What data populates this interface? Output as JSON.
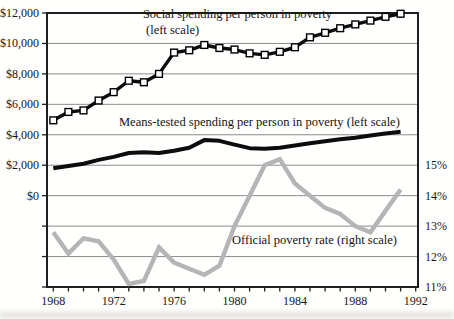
{
  "chart_data": {
    "type": "line",
    "x_years": [
      1968,
      1969,
      1970,
      1971,
      1972,
      1973,
      1974,
      1975,
      1976,
      1977,
      1978,
      1979,
      1980,
      1981,
      1982,
      1983,
      1984,
      1985,
      1986,
      1987,
      1988,
      1989,
      1990,
      1991
    ],
    "series": [
      {
        "name": "Social spending per person in poverty",
        "axis": "left",
        "marker": "white-square",
        "values": [
          4950,
          5500,
          5600,
          6250,
          6800,
          7550,
          7450,
          8000,
          9400,
          9550,
          9900,
          9700,
          9600,
          9350,
          9250,
          9450,
          9750,
          10400,
          10700,
          11000,
          11250,
          11500,
          11750,
          11950
        ]
      },
      {
        "name": "Means-tested spending per person in poverty",
        "axis": "left",
        "marker": "none",
        "values": [
          1800,
          1950,
          2100,
          2350,
          2550,
          2800,
          2850,
          2800,
          2950,
          3150,
          3650,
          3600,
          3350,
          3120,
          3080,
          3150,
          3300,
          3450,
          3570,
          3700,
          3800,
          3950,
          4080,
          4200
        ]
      },
      {
        "name": "Official poverty rate",
        "axis": "right",
        "marker": "none",
        "values": [
          12.8,
          12.1,
          12.6,
          12.5,
          11.9,
          11.1,
          11.2,
          12.3,
          11.8,
          11.6,
          11.4,
          11.7,
          13.0,
          14.0,
          15.0,
          15.2,
          14.4,
          14.0,
          13.6,
          13.4,
          13.0,
          12.8,
          13.5,
          14.2
        ]
      }
    ],
    "left_axis": {
      "ticks": [
        "$12,000",
        "$10,000",
        "$8,000",
        "$6,000",
        "$4,000",
        "$2,000",
        "$0"
      ],
      "max": 12000,
      "tick_interval": 2000
    },
    "right_axis": {
      "ticks": [
        "15%",
        "14%",
        "13%",
        "12%",
        "11%"
      ],
      "min": 11,
      "max": 15,
      "per_grid": 1
    },
    "x_axis": {
      "labeled_years": [
        "1968",
        "1972",
        "1976",
        "1980",
        "1984",
        "1988",
        "1992"
      ],
      "first_year": 1968,
      "last_year": 1992
    },
    "grid": true,
    "legend_position": "inline-annotations",
    "annotations": [
      {
        "text": "Social spending per person in poverty"
      },
      {
        "text": "(left scale)"
      },
      {
        "text": "Means-tested spending per person in poverty (left scale)"
      },
      {
        "text": "Official poverty rate (right scale)"
      }
    ],
    "colors": {
      "social_line": "#0d0d0d",
      "social_marker_fill": "#ffffff",
      "means_tested_line": "#0d0d0d",
      "poverty_rate_line": "#b5b5b5",
      "gridline": "#8c8c8c",
      "frame": "#1f1f1f",
      "text": "#161616"
    }
  }
}
